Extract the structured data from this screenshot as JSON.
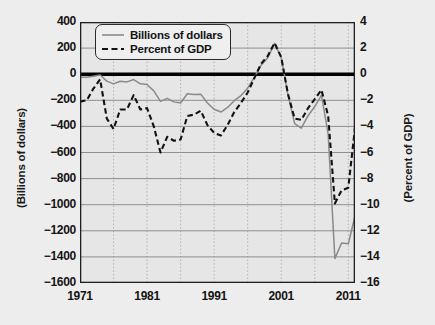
{
  "chart_data": {
    "type": "line",
    "title": "",
    "xlabel": "",
    "ylabel": "(Billions of dollars)",
    "y2label": "(Percent of GDP)",
    "xlim": [
      1971,
      2012
    ],
    "ylim": [
      -1600,
      400
    ],
    "y2lim": [
      -16,
      4
    ],
    "grid": true,
    "legend_position": "upper-left-inside",
    "xticks": [
      "1971",
      "1981",
      "1991",
      "2001",
      "2011"
    ],
    "xtick_values": [
      1971,
      1981,
      1991,
      2001,
      2011
    ],
    "yticks_left": [
      "400",
      "200",
      "0",
      "−200",
      "−400",
      "−600",
      "−800",
      "−1000",
      "−1200",
      "−1400",
      "−1600"
    ],
    "ytick_values_left": [
      400,
      200,
      0,
      -200,
      -400,
      -600,
      -800,
      -1000,
      -1200,
      -1400,
      -1600
    ],
    "yticks_right": [
      "4",
      "2",
      "0",
      "−2",
      "−4",
      "−6",
      "−8",
      "−10",
      "−12",
      "−14",
      "−16"
    ],
    "ytick_values_right": [
      4,
      2,
      0,
      -2,
      -4,
      -6,
      -8,
      -10,
      -12,
      -14,
      -16
    ],
    "zero_line": 0,
    "x": [
      1971,
      1972,
      1973,
      1974,
      1975,
      1976,
      1977,
      1978,
      1979,
      1980,
      1981,
      1982,
      1983,
      1984,
      1985,
      1986,
      1987,
      1988,
      1989,
      1990,
      1991,
      1992,
      1993,
      1994,
      1995,
      1996,
      1997,
      1998,
      1999,
      2000,
      2001,
      2002,
      2003,
      2004,
      2005,
      2006,
      2007,
      2008,
      2009,
      2010,
      2011,
      2012
    ],
    "series": [
      {
        "name": "Billions of dollars",
        "axis": "left",
        "color": "#8a8a8a",
        "style": "solid",
        "values": [
          -23,
          -23,
          -15,
          -6,
          -53,
          -74,
          -54,
          -59,
          -41,
          -74,
          -79,
          -128,
          -208,
          -185,
          -212,
          -221,
          -150,
          -155,
          -153,
          -221,
          -269,
          -290,
          -255,
          -203,
          -164,
          -107,
          -22,
          69,
          126,
          236,
          128,
          -158,
          -378,
          -413,
          -318,
          -248,
          -161,
          -459,
          -1413,
          -1294,
          -1300,
          -1087
        ]
      },
      {
        "name": "Percent of GDP",
        "axis": "right",
        "color": "#121212",
        "style": "dashed",
        "values": [
          -2.1,
          -2.0,
          -1.1,
          -0.4,
          -3.4,
          -4.2,
          -2.7,
          -2.7,
          -1.6,
          -2.7,
          -2.6,
          -4.0,
          -6.0,
          -4.8,
          -5.1,
          -5.0,
          -3.2,
          -3.1,
          -2.8,
          -3.9,
          -4.5,
          -4.7,
          -3.9,
          -2.9,
          -2.2,
          -1.4,
          -0.3,
          0.8,
          1.4,
          2.4,
          1.3,
          -1.5,
          -3.4,
          -3.5,
          -2.6,
          -1.9,
          -1.2,
          -3.2,
          -9.9,
          -8.9,
          -8.7,
          -4.1
        ]
      }
    ]
  },
  "legend": {
    "items": [
      {
        "label": "Billions of dollars",
        "style": "solid",
        "color": "#8a8a8a"
      },
      {
        "label": "Percent of GDP",
        "style": "dashed",
        "color": "#121212"
      }
    ]
  }
}
